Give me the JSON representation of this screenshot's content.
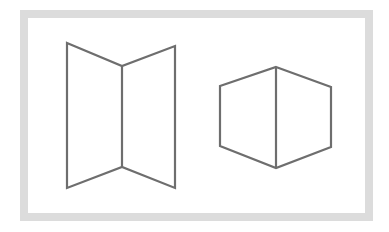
{
  "frame": {
    "border_color": "#dcdcdc"
  },
  "figures": {
    "stroke_color": "#6e6e6e",
    "left": {
      "name": "open-book-folded-panels",
      "outline": "67,43 122,66 175,46 175,188 122,167 67,188",
      "spine": "122,66 122,167"
    },
    "right": {
      "name": "hexagonal-prism-corner",
      "outline": "276,67 331,87 331,147 276,168 220,146 220,86",
      "spine": "276,67 276,168"
    }
  }
}
